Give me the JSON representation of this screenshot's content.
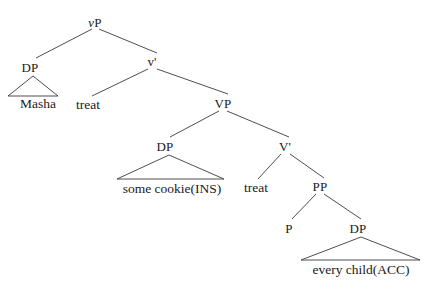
{
  "figure": {
    "kind": "syntax-tree",
    "background_color": "#ffffff",
    "line_color": "#3a3a3a",
    "text_color": "#1a1a1a"
  },
  "nodes": {
    "vp": {
      "label": "vP",
      "italic_first_letter": "v",
      "rest": "P",
      "x": 95,
      "y": 22
    },
    "dp_subject": {
      "label": "DP",
      "x": 30,
      "y": 67
    },
    "vbar": {
      "label": "v'",
      "x": 152,
      "y": 61
    },
    "vp_lower": {
      "label": "VP",
      "x": 223,
      "y": 103
    },
    "dp_object": {
      "label": "DP",
      "x": 165,
      "y": 146
    },
    "vbar_lower": {
      "label": "V'",
      "x": 285,
      "y": 146
    },
    "pp": {
      "label": "PP",
      "x": 320,
      "y": 186
    },
    "p_head": {
      "label": "P",
      "x": 289,
      "y": 228
    },
    "dp_pp": {
      "label": "DP",
      "x": 358,
      "y": 228
    }
  },
  "leaves": {
    "masha": {
      "label": "Masha",
      "x": 38,
      "y": 104
    },
    "treat_upper": {
      "label": "treat",
      "x": 88,
      "y": 105
    },
    "some_cookie": {
      "label": "some cookie(INS)",
      "x": 172,
      "y": 189
    },
    "treat_lower": {
      "label": "treat",
      "x": 256,
      "y": 188
    },
    "every_child": {
      "label": "every child(ACC)",
      "x": 361,
      "y": 270
    }
  },
  "branches": [
    {
      "name": "vp-to-dp-subject",
      "x1": 92,
      "y1": 29,
      "x2": 36,
      "y2": 58
    },
    {
      "name": "vp-to-vbar",
      "x1": 99,
      "y1": 29,
      "x2": 157,
      "y2": 53
    },
    {
      "name": "vbar-to-treat",
      "x1": 148,
      "y1": 69,
      "x2": 92,
      "y2": 96
    },
    {
      "name": "vbar-to-vp-lower",
      "x1": 157,
      "y1": 69,
      "x2": 228,
      "y2": 94
    },
    {
      "name": "vp-lower-to-dp-object",
      "x1": 219,
      "y1": 111,
      "x2": 170,
      "y2": 137
    },
    {
      "name": "vp-lower-to-vbar-lower",
      "x1": 227,
      "y1": 111,
      "x2": 289,
      "y2": 137
    },
    {
      "name": "vbar-lower-to-treat",
      "x1": 281,
      "y1": 154,
      "x2": 258,
      "y2": 179
    },
    {
      "name": "vbar-lower-to-pp",
      "x1": 290,
      "y1": 154,
      "x2": 324,
      "y2": 178
    },
    {
      "name": "pp-to-p",
      "x1": 316,
      "y1": 194,
      "x2": 292,
      "y2": 219
    },
    {
      "name": "pp-to-dp",
      "x1": 324,
      "y1": 194,
      "x2": 361,
      "y2": 219
    }
  ],
  "triangles": [
    {
      "name": "masha-triangle",
      "apex_x": 33,
      "apex_y": 76,
      "left_x": 8,
      "left_y": 96,
      "right_x": 58,
      "right_y": 96
    },
    {
      "name": "some-cookie-triangle",
      "apex_x": 169,
      "apex_y": 155,
      "left_x": 117,
      "left_y": 179,
      "right_x": 224,
      "right_y": 179
    },
    {
      "name": "every-child-triangle",
      "apex_x": 361,
      "apex_y": 237,
      "left_x": 301,
      "left_y": 260,
      "right_x": 420,
      "right_y": 260
    }
  ]
}
